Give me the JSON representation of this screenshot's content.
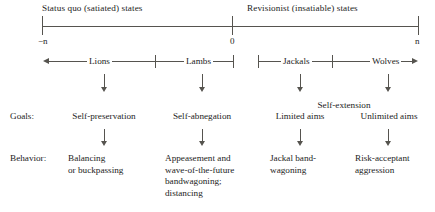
{
  "figure": {
    "title_left": "Status quo (satiated) states",
    "title_right": "Revisionist (insatiable) states",
    "axis": {
      "left_label": "−n",
      "center_label": "0",
      "right_label": "n"
    },
    "categories": [
      {
        "label": "Lions"
      },
      {
        "label": "Lambs"
      },
      {
        "label": "Jackals"
      },
      {
        "label": "Wolves"
      }
    ],
    "rows": [
      {
        "label": "Goals:",
        "span_label": "Self-extension",
        "cells": [
          "Self-preservation",
          "Self-abnegation",
          "Limited aims",
          "Unlimited aims"
        ]
      },
      {
        "label": "Behavior:",
        "cells": [
          "Balancing\nor buckpassing",
          "Appeasement and\nwave-of-the-future\nbandwagoning;\ndistancing",
          "Jackal band-\nwagoning",
          "Risk-acceptant\naggression"
        ]
      }
    ],
    "colors": {
      "ink": "#1d1d1d",
      "rule": "#56544f",
      "background": "#ffffff"
    }
  }
}
